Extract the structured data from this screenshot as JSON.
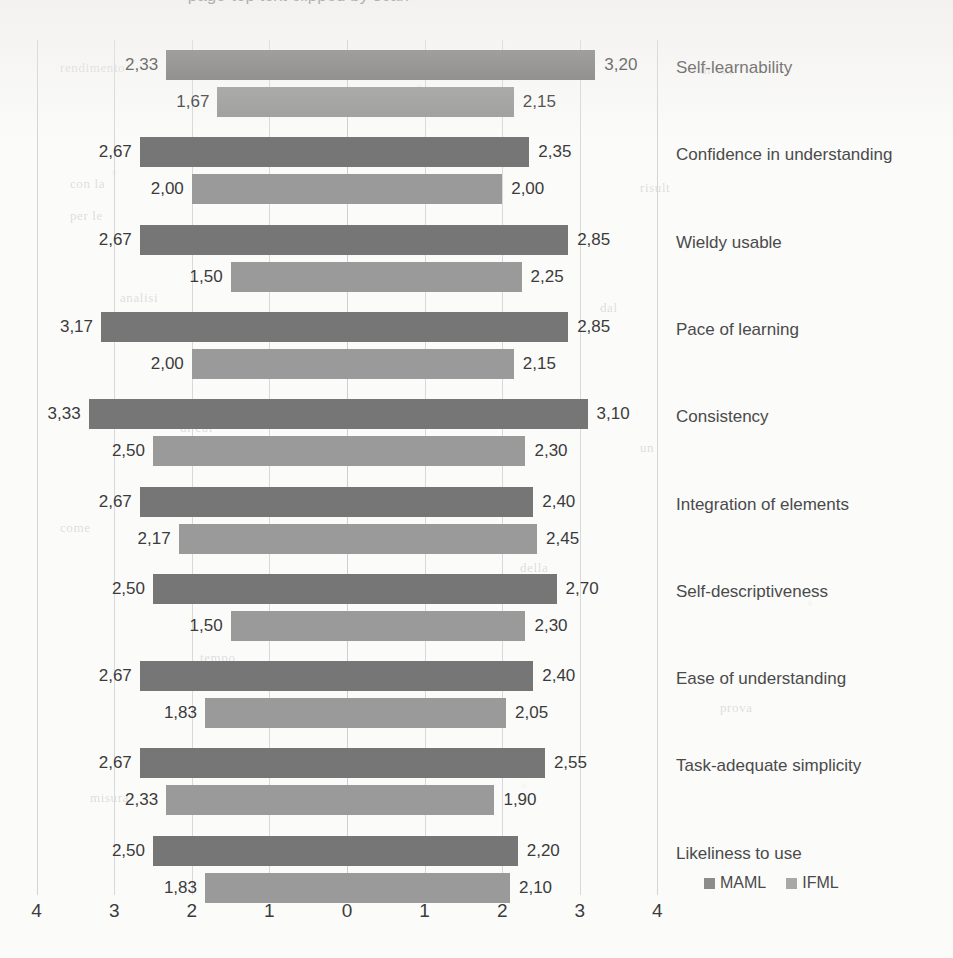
{
  "page": {
    "background": "#fbfbfa",
    "title_partial": "— page-top text clipped by scan —"
  },
  "legend": {
    "position": "bottom-right",
    "entries": [
      {
        "label": "MAML",
        "color": "#767676"
      },
      {
        "label": "IFML",
        "color": "#9a9a9a"
      }
    ]
  },
  "axis": {
    "ticks": [
      "4",
      "3",
      "2",
      "1",
      "0",
      "1",
      "2",
      "3",
      "4"
    ],
    "tick_values": [
      -4,
      -3,
      -2,
      -1,
      0,
      1,
      2,
      3,
      4
    ]
  },
  "bleed_text": [
    {
      "x": 60,
      "y": 60,
      "text": "rendimento"
    },
    {
      "x": 300,
      "y": 58,
      "text": "si aum"
    },
    {
      "x": 700,
      "y": 62,
      "text": "di val"
    },
    {
      "x": 70,
      "y": 176,
      "text": "con la"
    },
    {
      "x": 330,
      "y": 172,
      "text": "strum"
    },
    {
      "x": 640,
      "y": 180,
      "text": "risult"
    },
    {
      "x": 70,
      "y": 208,
      "text": "per le"
    },
    {
      "x": 120,
      "y": 290,
      "text": "analisi"
    },
    {
      "x": 600,
      "y": 300,
      "text": "dal"
    },
    {
      "x": 180,
      "y": 420,
      "text": "di cui"
    },
    {
      "x": 640,
      "y": 440,
      "text": "un"
    },
    {
      "x": 60,
      "y": 520,
      "text": "come"
    },
    {
      "x": 520,
      "y": 560,
      "text": "della"
    },
    {
      "x": 200,
      "y": 650,
      "text": "tempo"
    },
    {
      "x": 720,
      "y": 700,
      "text": "prova"
    },
    {
      "x": 90,
      "y": 790,
      "text": "misura"
    },
    {
      "x": 420,
      "y": 840,
      "text": "valori"
    }
  ],
  "chart_data": {
    "type": "bar",
    "orientation": "horizontal-diverging",
    "title": "",
    "xlabel": "",
    "ylabel": "",
    "xlim": [
      -4,
      4
    ],
    "grid": true,
    "legend_position": "bottom-right",
    "note": "Diverging (tornado) bar chart. Left side values are plotted toward the left of the zero axis; right side values toward the right. Both printed as positive magnitudes with comma decimal separator.",
    "categories": [
      "Self-learnability",
      "Confidence in understanding",
      "Wieldy usable",
      "Pace of learning",
      "Consistency",
      "Integration of elements",
      "Self-descriptiveness",
      "Ease of understanding",
      "Task-adequate simplicity",
      "Likeliness to use"
    ],
    "series": [
      {
        "name": "MAML",
        "color": "#767676",
        "left_values": [
          2.33,
          2.67,
          2.67,
          3.17,
          3.33,
          2.67,
          2.5,
          2.67,
          2.67,
          2.5
        ],
        "right_values": [
          3.2,
          2.35,
          2.85,
          2.85,
          3.1,
          2.4,
          2.7,
          2.4,
          2.55,
          2.2
        ],
        "left_labels": [
          "2,33",
          "2,67",
          "2,67",
          "3,17",
          "3,33",
          "2,67",
          "2,50",
          "2,67",
          "2,67",
          "2,50"
        ],
        "right_labels": [
          "3,20",
          "2,35",
          "2,85",
          "2,85",
          "3,10",
          "2,40",
          "2,70",
          "2,40",
          "2,55",
          "2,20"
        ]
      },
      {
        "name": "IFML",
        "color": "#9a9a9a",
        "left_values": [
          1.67,
          2.0,
          1.5,
          2.0,
          2.5,
          2.17,
          1.5,
          1.83,
          2.33,
          1.83
        ],
        "right_values": [
          2.15,
          2.0,
          2.25,
          2.15,
          2.3,
          2.45,
          2.3,
          2.05,
          1.9,
          2.1
        ],
        "left_labels": [
          "1,67",
          "2,00",
          "1,50",
          "2,00",
          "2,50",
          "2,17",
          "1,50",
          "1,83",
          "2,33",
          "1,83"
        ],
        "right_labels": [
          "2,15",
          "2,00",
          "2,25",
          "2,15",
          "2,30",
          "2,45",
          "2,30",
          "2,05",
          "1,90",
          "2,10"
        ]
      }
    ]
  }
}
